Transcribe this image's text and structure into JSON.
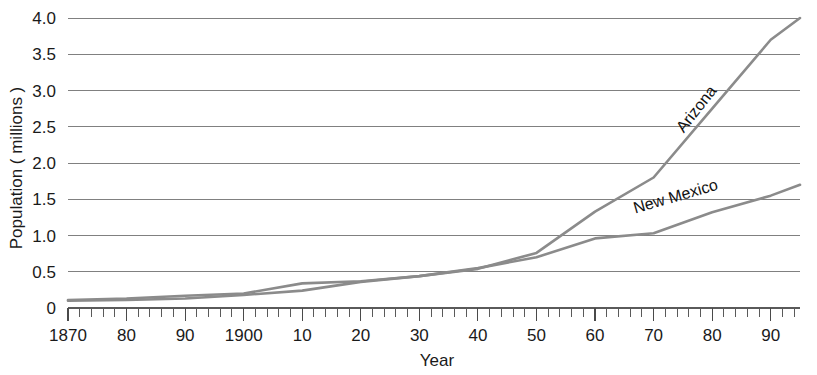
{
  "chart_data": {
    "type": "line",
    "title": "",
    "xlabel": "Year",
    "ylabel": "Population ( millions )",
    "xlim": [
      1870,
      1995
    ],
    "ylim": [
      0,
      4.0
    ],
    "grid": true,
    "legend_position": "inline-labels",
    "y_ticks": [
      "0",
      "0.5",
      "1.0",
      "1.5",
      "2.0",
      "2.5",
      "3.0",
      "3.5",
      "4.0"
    ],
    "y_tick_values": [
      0,
      0.5,
      1.0,
      1.5,
      2.0,
      2.5,
      3.0,
      3.5,
      4.0
    ],
    "x_ticks": [
      "1870",
      "80",
      "90",
      "1900",
      "10",
      "20",
      "30",
      "40",
      "50",
      "60",
      "70",
      "80",
      "90"
    ],
    "x_tick_values": [
      1870,
      1880,
      1890,
      1900,
      1910,
      1920,
      1930,
      1940,
      1950,
      1960,
      1970,
      1980,
      1990
    ],
    "x_minor_tick_step": 2,
    "x": [
      1870,
      1880,
      1890,
      1900,
      1910,
      1920,
      1930,
      1940,
      1950,
      1960,
      1970,
      1980,
      1990,
      1995
    ],
    "series": [
      {
        "name": "Arizona",
        "color": "#8b8b8b",
        "values": [
          0.1,
          0.11,
          0.13,
          0.18,
          0.24,
          0.36,
          0.44,
          0.54,
          0.76,
          1.33,
          1.8,
          2.75,
          3.7,
          4.0
        ],
        "label_x": 1978,
        "label_y": 2.7,
        "label_rotation": -52
      },
      {
        "name": "New Mexico",
        "color": "#8b8b8b",
        "values": [
          0.11,
          0.13,
          0.17,
          0.2,
          0.34,
          0.37,
          0.44,
          0.55,
          0.7,
          0.96,
          1.03,
          1.32,
          1.55,
          1.7
        ],
        "label_x": 1974,
        "label_y": 1.47,
        "label_rotation": -16
      }
    ]
  },
  "axes": {
    "y_title": "Population ( millions )",
    "x_title": "Year"
  }
}
